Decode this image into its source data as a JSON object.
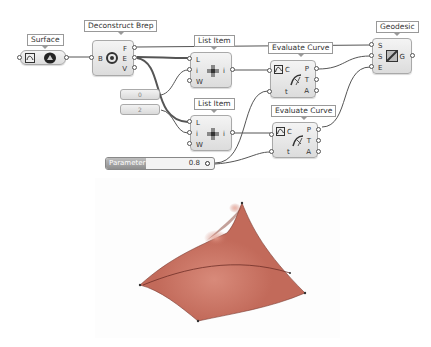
{
  "canvas": {
    "nodes": {
      "surface": {
        "label": "Surface",
        "icon": "surface-param-icon"
      },
      "deconstruct_brep": {
        "label": "Deconstruct Brep",
        "inputs": [
          "B"
        ],
        "outputs": [
          "F",
          "E",
          "V"
        ],
        "icon": "deconstruct-brep-icon"
      },
      "list_item_1": {
        "label": "List Item",
        "inputs": [
          "L",
          "i",
          "W"
        ],
        "outputs": [
          "i"
        ],
        "icon": "list-item-icon"
      },
      "list_item_2": {
        "label": "List Item",
        "inputs": [
          "L",
          "i",
          "W"
        ],
        "outputs": [
          "i"
        ],
        "icon": "list-item-icon"
      },
      "evaluate_curve_1": {
        "label": "Evaluate Curve",
        "inputs": [
          "C",
          "t"
        ],
        "outputs": [
          "P",
          "T",
          "A"
        ],
        "icon": "evaluate-curve-icon"
      },
      "evaluate_curve_2": {
        "label": "Evaluate Curve",
        "inputs": [
          "C",
          "t"
        ],
        "outputs": [
          "P",
          "T",
          "A"
        ],
        "icon": "evaluate-curve-icon"
      },
      "geodesic": {
        "label": "Geodesic",
        "inputs": [
          "S",
          "S",
          "E"
        ],
        "outputs": [
          "G"
        ],
        "icon": "geodesic-icon"
      }
    },
    "panels": {
      "index_0": "0",
      "index_2": "2"
    },
    "slider": {
      "label": "Parameter",
      "value": "0.8"
    }
  },
  "viewport": {
    "surface_color": "#c26a5a",
    "geodesic_color": "#6e2f27"
  }
}
